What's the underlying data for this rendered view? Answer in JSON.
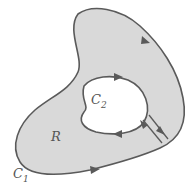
{
  "diagram": {
    "region_label": "R",
    "outer_curve_label": "C",
    "outer_curve_sub": "1",
    "inner_curve_label": "C",
    "inner_curve_sub": "2",
    "colors": {
      "fill": "#d9d9d9",
      "stroke": "#5a5a5a",
      "hole": "#ffffff"
    }
  }
}
